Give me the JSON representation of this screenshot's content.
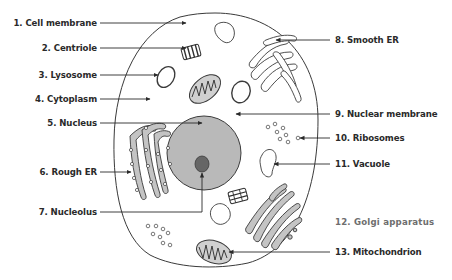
{
  "diagram": {
    "type": "animal-cell",
    "colors": {
      "outline": "#3a3a3a",
      "nucleus_fill": "#b8b8b8",
      "nucleolus_fill": "#6a6a6a",
      "organelle_fill": "#bdbdbd",
      "text": "#2a2a2a"
    }
  },
  "labels": {
    "left": [
      {
        "id": 1,
        "text": "1. Cell membrane"
      },
      {
        "id": 2,
        "text": "2. Centriole"
      },
      {
        "id": 3,
        "text": "3. Lysosome"
      },
      {
        "id": 4,
        "text": "4. Cytoplasm"
      },
      {
        "id": 5,
        "text": "5. Nucleus"
      },
      {
        "id": 6,
        "text": "6. Rough ER"
      },
      {
        "id": 7,
        "text": "7. Nucleolus"
      }
    ],
    "right": [
      {
        "id": 8,
        "text": "8. Smooth ER"
      },
      {
        "id": 9,
        "text": "9. Nuclear membrane"
      },
      {
        "id": 10,
        "text": "10. Ribosomes"
      },
      {
        "id": 11,
        "text": "11. Vacuole"
      },
      {
        "id": 12,
        "text": "12. Golgi apparatus"
      },
      {
        "id": 13,
        "text": "13. Mitochondrion"
      }
    ]
  }
}
